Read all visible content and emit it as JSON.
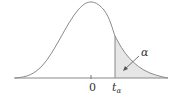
{
  "diagram": {
    "type": "t-distribution right-tail area",
    "labels": {
      "center_tick": "0",
      "critical_value": "t",
      "critical_subscript": "α",
      "area_label": "α"
    },
    "colors": {
      "curve": "#8a8a8a",
      "shade": "#e6e6e6",
      "axis": "#888888",
      "text": "#333333"
    }
  }
}
